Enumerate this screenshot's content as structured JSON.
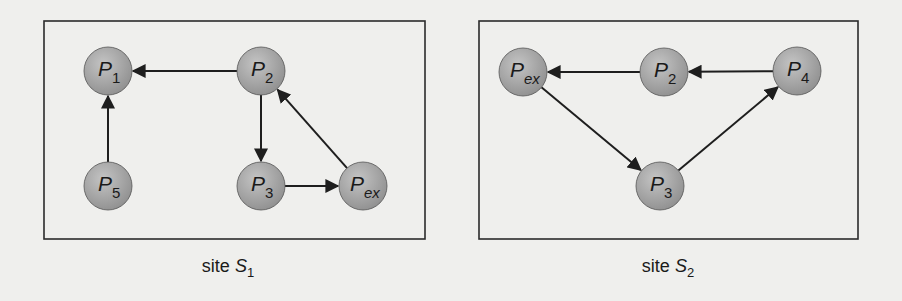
{
  "colors": {
    "background": "#efefed",
    "box_stroke": "#2b2b2b",
    "edge": "#1e1e1e",
    "node_fill_light": "#bdbdbd",
    "node_fill_dark": "#8f8f8f",
    "text": "#1a1a1a"
  },
  "sites": [
    {
      "name": "site S1",
      "caption": {
        "prefix": "site ",
        "symbol": "S",
        "subscript": "1"
      },
      "box": {
        "x": 44,
        "y": 21,
        "width": 381,
        "height": 218
      },
      "nodes": [
        {
          "id": "P1",
          "symbol": "P",
          "subscript": "1",
          "x": 108,
          "y": 71
        },
        {
          "id": "P2",
          "symbol": "P",
          "subscript": "2",
          "x": 261,
          "y": 71
        },
        {
          "id": "P3",
          "symbol": "P",
          "subscript": "3",
          "x": 261,
          "y": 186
        },
        {
          "id": "P5",
          "symbol": "P",
          "subscript": "5",
          "x": 108,
          "y": 186
        },
        {
          "id": "Pex",
          "symbol": "P",
          "subscript": "ex",
          "x": 363,
          "y": 186
        }
      ],
      "edges": [
        {
          "from": "P2",
          "to": "P1"
        },
        {
          "from": "P5",
          "to": "P1"
        },
        {
          "from": "P2",
          "to": "P3"
        },
        {
          "from": "P3",
          "to": "Pex"
        },
        {
          "from": "Pex",
          "to": "P2"
        }
      ]
    },
    {
      "name": "site S2",
      "caption": {
        "prefix": "site ",
        "symbol": "S",
        "subscript": "2"
      },
      "box": {
        "x": 479,
        "y": 21,
        "width": 379,
        "height": 218
      },
      "nodes": [
        {
          "id": "Pex",
          "symbol": "P",
          "subscript": "ex",
          "x": 523,
          "y": 72
        },
        {
          "id": "P2",
          "symbol": "P",
          "subscript": "2",
          "x": 664,
          "y": 72
        },
        {
          "id": "P4",
          "symbol": "P",
          "subscript": "4",
          "x": 797,
          "y": 71
        },
        {
          "id": "P3",
          "symbol": "P",
          "subscript": "3",
          "x": 660,
          "y": 186
        }
      ],
      "edges": [
        {
          "from": "P2",
          "to": "Pex"
        },
        {
          "from": "P4",
          "to": "P2"
        },
        {
          "from": "Pex",
          "to": "P3"
        },
        {
          "from": "P3",
          "to": "P4"
        }
      ]
    }
  ],
  "layout": {
    "node_radius": 24,
    "captions": [
      {
        "x": 228,
        "y": 272
      },
      {
        "x": 668,
        "y": 272
      }
    ]
  }
}
